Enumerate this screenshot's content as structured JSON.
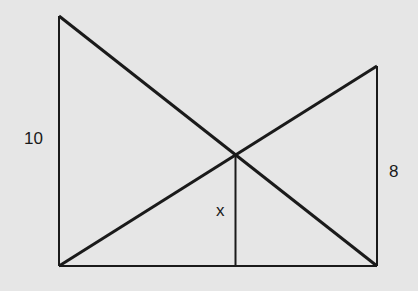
{
  "diagram": {
    "labels": {
      "left_height": "10",
      "right_height": "8",
      "unknown": "x"
    },
    "colors": {
      "background": "#e6e6e6",
      "stroke": "#1a1a1a"
    }
  }
}
